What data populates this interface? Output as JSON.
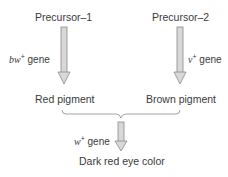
{
  "nodes": {
    "precursor1": "Precursor–1",
    "precursor2": "Precursor–2",
    "red_pigment": "Red pigment",
    "brown_pigment": "Brown pigment",
    "result": "Dark red eye color"
  },
  "genes": {
    "bw": {
      "symbol": "bw",
      "sup": "+",
      "word": "gene"
    },
    "v": {
      "symbol": "v",
      "sup": "+",
      "word": "gene"
    },
    "w": {
      "symbol": "w",
      "sup": "+",
      "word": "gene"
    }
  },
  "colors": {
    "text": "#3a3a3a",
    "arrow_fill": "#d8d8d8",
    "arrow_stroke": "#8a8a8a",
    "brace": "#9a9a9a"
  }
}
